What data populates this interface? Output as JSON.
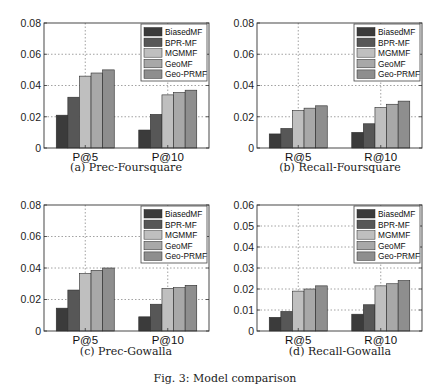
{
  "figure_caption": "Fig. 3: Model comparison",
  "legend": {
    "entries": [
      "BiasedMF",
      "BPR-MF",
      "MGMMF",
      "GeoMF",
      "Geo-PRMF"
    ],
    "colors": [
      "#3b3b3b",
      "#575757",
      "#bfbfbf",
      "#a8a8a8",
      "#8e8e8e"
    ],
    "position": "upper-right"
  },
  "chart_data": [
    {
      "type": "bar",
      "title": "(a) Prec-Foursquare",
      "xlabel": "",
      "ylabel": "",
      "categories": [
        "P@5",
        "P@10"
      ],
      "series": [
        {
          "name": "BiasedMF",
          "values": [
            0.021,
            0.0115
          ]
        },
        {
          "name": "BPR-MF",
          "values": [
            0.0325,
            0.0215
          ]
        },
        {
          "name": "MGMMF",
          "values": [
            0.046,
            0.034
          ]
        },
        {
          "name": "GeoMF",
          "values": [
            0.048,
            0.0355
          ]
        },
        {
          "name": "Geo-PRMF",
          "values": [
            0.05,
            0.037
          ]
        }
      ],
      "ylim": [
        0,
        0.08
      ],
      "yticks": [
        "0",
        "0.02",
        "0.04",
        "0.06",
        "0.08"
      ],
      "ytick_values": [
        0,
        0.02,
        0.04,
        0.06,
        0.08
      ],
      "grid": true,
      "legend_position": "upper-right"
    },
    {
      "type": "bar",
      "title": "(b) Recall-Foursquare",
      "xlabel": "",
      "ylabel": "",
      "categories": [
        "R@5",
        "R@10"
      ],
      "series": [
        {
          "name": "BiasedMF",
          "values": [
            0.009,
            0.01
          ]
        },
        {
          "name": "BPR-MF",
          "values": [
            0.0125,
            0.0155
          ]
        },
        {
          "name": "MGMMF",
          "values": [
            0.024,
            0.026
          ]
        },
        {
          "name": "GeoMF",
          "values": [
            0.0255,
            0.028
          ]
        },
        {
          "name": "Geo-PRMF",
          "values": [
            0.027,
            0.03
          ]
        }
      ],
      "ylim": [
        0,
        0.08
      ],
      "yticks": [
        "0",
        "0.02",
        "0.04",
        "0.06",
        "0.08"
      ],
      "ytick_values": [
        0,
        0.02,
        0.04,
        0.06,
        0.08
      ],
      "grid": true,
      "legend_position": "upper-right"
    },
    {
      "type": "bar",
      "title": "(c) Prec-Gowalla",
      "xlabel": "",
      "ylabel": "",
      "categories": [
        "P@5",
        "P@10"
      ],
      "series": [
        {
          "name": "BiasedMF",
          "values": [
            0.0145,
            0.009
          ]
        },
        {
          "name": "BPR-MF",
          "values": [
            0.026,
            0.017
          ]
        },
        {
          "name": "MGMMF",
          "values": [
            0.0365,
            0.027
          ]
        },
        {
          "name": "GeoMF",
          "values": [
            0.0385,
            0.0275
          ]
        },
        {
          "name": "Geo-PRMF",
          "values": [
            0.04,
            0.029
          ]
        }
      ],
      "ylim": [
        0,
        0.08
      ],
      "yticks": [
        "0",
        "0.02",
        "0.04",
        "0.06",
        "0.08"
      ],
      "ytick_values": [
        0,
        0.02,
        0.04,
        0.06,
        0.08
      ],
      "grid": true,
      "legend_position": "upper-right"
    },
    {
      "type": "bar",
      "title": "(d) Recall-Gowalla",
      "xlabel": "",
      "ylabel": "",
      "categories": [
        "R@5",
        "R@10"
      ],
      "series": [
        {
          "name": "BiasedMF",
          "values": [
            0.0065,
            0.008
          ]
        },
        {
          "name": "BPR-MF",
          "values": [
            0.0093,
            0.0125
          ]
        },
        {
          "name": "MGMMF",
          "values": [
            0.019,
            0.0215
          ]
        },
        {
          "name": "GeoMF",
          "values": [
            0.02,
            0.0225
          ]
        },
        {
          "name": "Geo-PRMF",
          "values": [
            0.0215,
            0.024
          ]
        }
      ],
      "ylim": [
        0,
        0.06
      ],
      "yticks": [
        "0",
        "0.01",
        "0.02",
        "0.03",
        "0.04",
        "0.05",
        "0.06"
      ],
      "ytick_values": [
        0,
        0.01,
        0.02,
        0.03,
        0.04,
        0.05,
        0.06
      ],
      "grid": true,
      "legend_position": "upper-right"
    }
  ]
}
